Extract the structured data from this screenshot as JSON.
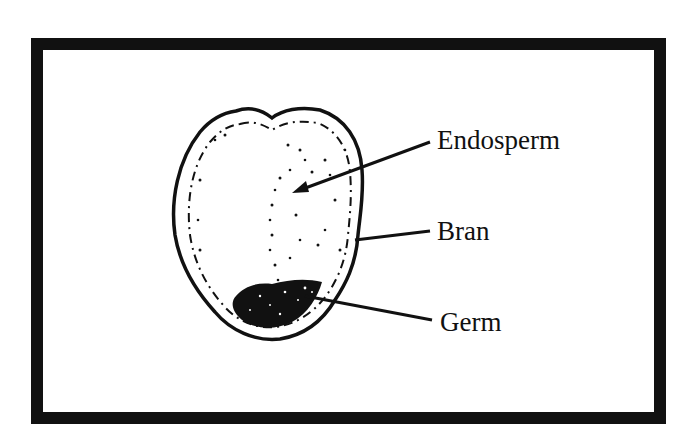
{
  "diagram": {
    "labels": [
      {
        "id": "endosperm",
        "text": "Endosperm"
      },
      {
        "id": "bran",
        "text": "Bran"
      },
      {
        "id": "germ",
        "text": "Germ"
      }
    ]
  },
  "colors": {
    "ink": "#111111",
    "paper": "#ffffff"
  }
}
